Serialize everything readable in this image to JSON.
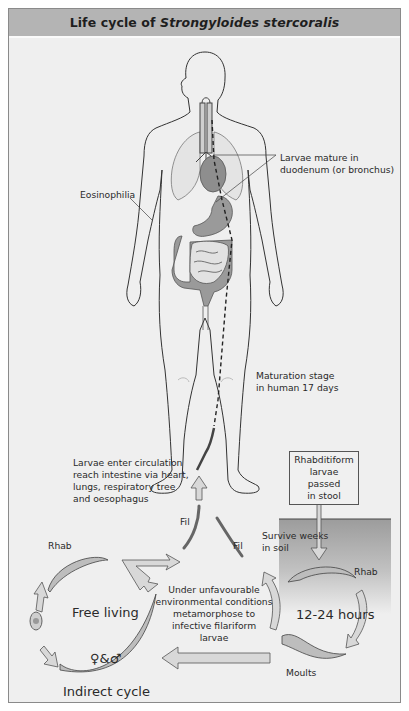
{
  "header": {
    "title_prefix": "Life cycle of ",
    "title_species": "Strongyloides stercoralis"
  },
  "labels": {
    "larvae_mature_1": "Larvae mature in",
    "larvae_mature_2": "duodenum (or bronchus)",
    "eosinophilia": "Eosinophilia",
    "maturation_1": "Maturation stage",
    "maturation_2": "in human 17 days",
    "circulation_1": "Larvae enter circulation",
    "circulation_2": "reach intestine via heart,",
    "circulation_3": "lungs, respiratory tree",
    "circulation_4": "and oesophagus",
    "rhabditiform_1": "Rhabditiform",
    "rhabditiform_2": "larvae passed",
    "rhabditiform_3": "in stool",
    "survive_1": "Survive weeks",
    "survive_2": "in soil",
    "rhab_left": "Rhab",
    "rhab_right": "Rhab",
    "fil_left": "Fil",
    "fil_right": "Fil",
    "unfavourable_1": "Under unfavourable",
    "unfavourable_2": "environmental conditions",
    "unfavourable_3": "metamorphose to",
    "unfavourable_4": "infective filariform",
    "unfavourable_5": "larvae",
    "hours": "12-24 hours",
    "moults": "Moults",
    "free_living": "Free living",
    "sexes": "♀&♂",
    "indirect_cycle": "Indirect cycle"
  },
  "colors": {
    "header_bg": "#b4b4b4",
    "panel_bg": "#efefef",
    "organ_fill": "#9a9a9a",
    "soil_top": "#9c9c9c",
    "arrow_fill": "#d8d8d8"
  }
}
